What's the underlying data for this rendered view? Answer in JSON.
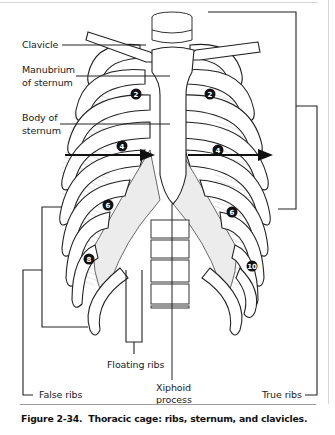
{
  "figure": {
    "number": "Figure 2-34.",
    "caption": "Thoracic cage: ribs, sternum, and clavicles."
  },
  "labels": {
    "clavicle": "Clavicle",
    "manubrium_line1": "Manubrium",
    "manubrium_line2": "of sternum",
    "body_line1": "Body of",
    "body_line2": "sternum",
    "floating_ribs": "Floating ribs",
    "xiphoid_line1": "Xiphoid",
    "xiphoid_line2": "process",
    "false_ribs": "False ribs",
    "true_ribs": "True ribs"
  },
  "rib_markers": {
    "left": [
      "2",
      "4",
      "6",
      "8"
    ],
    "right": [
      "2",
      "4",
      "6",
      "10"
    ]
  },
  "colors": {
    "ink": "#1a1a1a",
    "line": "#333333",
    "shading": "#e4e4e4",
    "frame": "#d6d6d6",
    "rule": "#9a9a9a"
  }
}
